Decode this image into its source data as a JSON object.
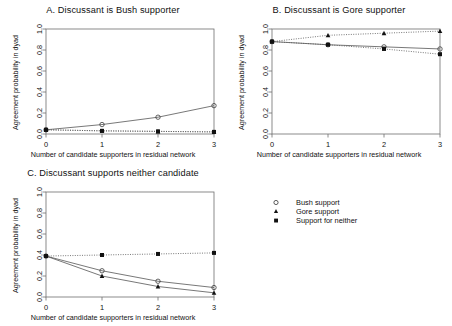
{
  "figure": {
    "axis_x_title": "Number of candidate supporters in residual network",
    "axis_y_title": "Agreement probability in dyad",
    "x_ticks": [
      "0",
      "1",
      "2",
      "3"
    ],
    "y_ticks": [
      "0.0",
      "0.2",
      "0.4",
      "0.6",
      "0.8",
      "1.0"
    ]
  },
  "legend": {
    "items": [
      {
        "label": "Bush support",
        "marker": "open-circle-marker"
      },
      {
        "label": "Gore support",
        "marker": "filled-triangle-marker"
      },
      {
        "label": "Support for neither",
        "marker": "filled-square-marker"
      }
    ]
  },
  "chart_data": [
    {
      "type": "line",
      "title": "A. Discussant is Bush supporter",
      "xlabel": "Number of candidate supporters in residual network",
      "ylabel": "Agreement probability in dyad",
      "x": [
        0,
        1,
        2,
        3
      ],
      "xlim": [
        0,
        3
      ],
      "ylim": [
        0.0,
        1.0
      ],
      "grid": false,
      "legend_position": "external-right",
      "series": [
        {
          "name": "Bush support",
          "marker": "open-circle",
          "values": [
            0.04,
            0.09,
            0.16,
            0.27
          ]
        },
        {
          "name": "Gore support",
          "marker": "filled-triangle",
          "values": [
            0.04,
            0.03,
            0.025,
            0.02
          ]
        },
        {
          "name": "Support for neither",
          "marker": "filled-square",
          "values": [
            0.04,
            0.03,
            0.025,
            0.02
          ]
        }
      ]
    },
    {
      "type": "line",
      "title": "B. Discussant is Gore supporter",
      "xlabel": "Number of candidate supporters in residual network",
      "ylabel": "Agreement probability in dyad",
      "x": [
        0,
        1,
        2,
        3
      ],
      "xlim": [
        0,
        3
      ],
      "ylim": [
        0.0,
        1.0
      ],
      "grid": false,
      "legend_position": "external-right",
      "series": [
        {
          "name": "Bush support",
          "marker": "open-circle",
          "values": [
            0.88,
            0.85,
            0.83,
            0.81
          ]
        },
        {
          "name": "Gore support",
          "marker": "filled-triangle",
          "values": [
            0.88,
            0.94,
            0.96,
            0.98
          ]
        },
        {
          "name": "Support for neither",
          "marker": "filled-square",
          "values": [
            0.88,
            0.85,
            0.81,
            0.76
          ]
        }
      ]
    },
    {
      "type": "line",
      "title": "C. Discussant supports neither candidate",
      "xlabel": "Number of candidate supporters in residual network",
      "ylabel": "Agreement probability in dyad",
      "x": [
        0,
        1,
        2,
        3
      ],
      "xlim": [
        0,
        3
      ],
      "ylim": [
        0.0,
        1.0
      ],
      "grid": false,
      "legend_position": "external-right",
      "series": [
        {
          "name": "Bush support",
          "marker": "open-circle",
          "values": [
            0.39,
            0.25,
            0.15,
            0.09
          ]
        },
        {
          "name": "Gore support",
          "marker": "filled-triangle",
          "values": [
            0.39,
            0.2,
            0.1,
            0.04
          ]
        },
        {
          "name": "Support for neither",
          "marker": "filled-square",
          "values": [
            0.39,
            0.4,
            0.41,
            0.42
          ]
        }
      ]
    }
  ]
}
